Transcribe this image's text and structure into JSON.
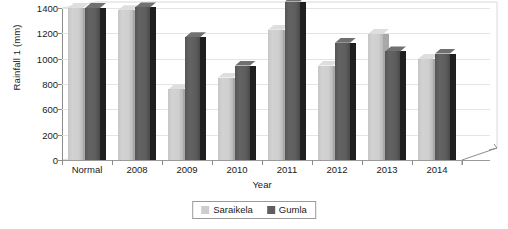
{
  "chart_data": {
    "type": "bar",
    "title": "",
    "xlabel": "Year",
    "ylabel": "Rainfall 1 (mm)",
    "categories": [
      "Normal",
      "2008",
      "2009",
      "2010",
      "2011",
      "2012",
      "2013",
      "2014"
    ],
    "series": [
      {
        "name": "Saraikela",
        "color": "#cdcdcd",
        "values": [
          1400,
          1380,
          650,
          760,
          1200,
          870,
          1160,
          930
        ]
      },
      {
        "name": "Gumla",
        "color": "#5f5f5f",
        "values": [
          1400,
          1405,
          1130,
          870,
          1460,
          1080,
          1000,
          980
        ]
      }
    ],
    "ylim": [
      0,
      1400
    ],
    "ytick_values": [
      0,
      200,
      600,
      800,
      1000,
      1200,
      1400
    ],
    "ytick_labels": [
      "0",
      "200",
      "600",
      "800",
      "1000",
      "1200",
      "1400"
    ],
    "grid": true,
    "legend_position": "bottom",
    "style": "3d-clustered-column"
  },
  "axis": {
    "y_title": "Rainfall 1 (mm)",
    "x_title": "Year"
  },
  "legend": {
    "items": [
      {
        "label": "Saraikela",
        "color": "#cdcdcd"
      },
      {
        "label": "Gumla",
        "color": "#5f5f5f"
      }
    ]
  }
}
